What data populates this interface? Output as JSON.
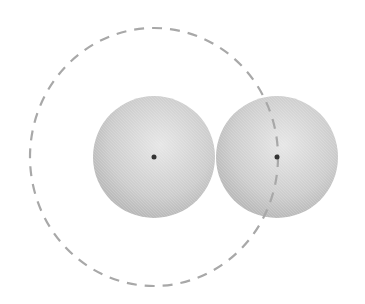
{
  "diagram": {
    "background": "#ffffff",
    "spheres": [
      {
        "id": "left",
        "cx": 154,
        "cy": 157,
        "r": 61,
        "color": "#c8c8c8"
      },
      {
        "id": "right",
        "cx": 277,
        "cy": 157,
        "r": 61,
        "color": "#c8c8c8"
      }
    ],
    "center_dots": [
      {
        "cx": 154,
        "cy": 157,
        "r": 2.5,
        "color": "#333333"
      },
      {
        "cx": 277,
        "cy": 157,
        "r": 2.5,
        "color": "#333333"
      }
    ],
    "dashed_circle": {
      "cx": 154,
      "cy": 157,
      "rx": 124,
      "ry": 129,
      "color": "#a8a8a8",
      "dash": "10 8"
    }
  }
}
